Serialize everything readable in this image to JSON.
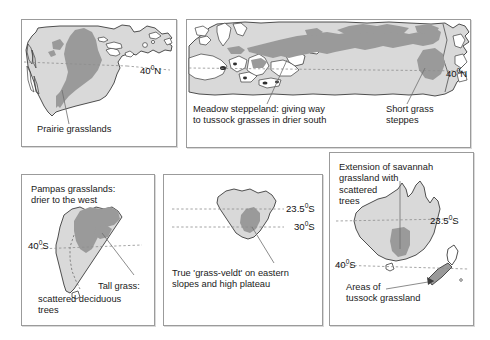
{
  "figure": {
    "panel_count": 5,
    "colors": {
      "land_fill": "#d9d9d9",
      "grassland_fill": "#9a9a9a",
      "coastline": "#3c3c3c",
      "latitude_line": "#8e8e8e",
      "panel_border": "#9b9b9b",
      "text": "#1a1a1a",
      "background": "#ffffff"
    }
  },
  "panels": [
    {
      "id": "north-america",
      "region": "North America",
      "caption": "Prairie grasslands",
      "latitudes": [
        {
          "label": "40",
          "hemisphere": "N",
          "text": "40°N"
        }
      ]
    },
    {
      "id": "eurasia",
      "region": "Eurasia",
      "caption_left": "Meadow steppeland: giving way\nto tussock grasses in drier south",
      "caption_right": "Short grass\nsteppes",
      "latitudes": [
        {
          "label": "40",
          "hemisphere": "N",
          "text": "40°N"
        }
      ]
    },
    {
      "id": "south-america",
      "region": "South America",
      "caption_top": "Pampas grasslands:\ndrier to the west",
      "caption_mid": "Tall grass:",
      "caption_bottom": "scattered deciduous\ntrees",
      "latitudes": [
        {
          "label": "40",
          "hemisphere": "S",
          "text": "40°S"
        }
      ]
    },
    {
      "id": "africa",
      "region": "Southern Africa",
      "caption": "True 'grass-veldt' on eastern\nslopes and high plateau",
      "latitudes": [
        {
          "label": "23.5",
          "hemisphere": "S",
          "text": "23.5°S"
        },
        {
          "label": "30",
          "hemisphere": "S",
          "text": "30°S"
        }
      ]
    },
    {
      "id": "australia",
      "region": "Australia and New Zealand",
      "caption_top": "Extension of savannah\ngrassland with\nscattered\ntrees",
      "caption_bottom": "Areas of\ntussock grassland",
      "latitudes": [
        {
          "label": "23.5",
          "hemisphere": "S",
          "text": "23.5°S"
        },
        {
          "label": "40",
          "hemisphere": "S",
          "text": "40°S"
        }
      ]
    }
  ],
  "labels": {
    "na_caption": "Prairie grasslands",
    "na_lat40n": "40°N",
    "eu_caption_left": "Meadow steppeland: giving way\nto tussock grasses in drier south",
    "eu_caption_right": "Short grass\nsteppes",
    "eu_lat40n": "40°N",
    "sa_caption_top": "Pampas grasslands:\ndrier to the west",
    "sa_caption_tall": "Tall grass:",
    "sa_caption_bottom": "scattered deciduous\ntrees",
    "sa_lat40s": "40°S",
    "af_caption": "True 'grass-veldt' on eastern\nslopes and high plateau",
    "af_lat235s": "23.5°S",
    "af_lat30s": "30°S",
    "au_caption_top": "Extension of savannah\ngrassland with\nscattered\ntrees",
    "au_caption_bottom": "Areas of\ntussock grassland",
    "au_lat235s": "23.5°S",
    "au_lat40s": "40°S"
  }
}
